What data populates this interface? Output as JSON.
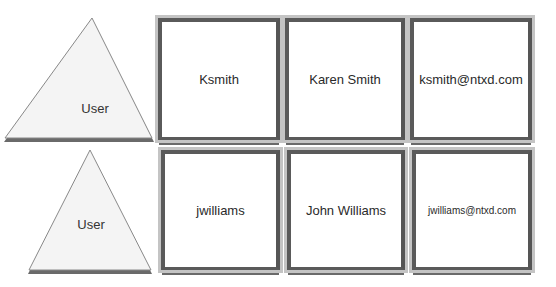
{
  "rows": [
    {
      "entity": "User",
      "cells": [
        "Ksmith",
        "Karen Smith",
        "ksmith@ntxd.com"
      ]
    },
    {
      "entity": "User",
      "cells": [
        "jwilliams",
        "John Williams",
        "jwilliams@ntxd.com"
      ]
    }
  ],
  "colors": {
    "frame_dark": "#5a5a5a",
    "frame_light": "#c4c4c4",
    "triangle_fill": "#f4f4f4"
  }
}
